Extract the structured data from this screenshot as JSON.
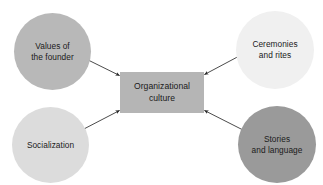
{
  "diagram": {
    "type": "convergent-influence-diagram",
    "background_color": "#ffffff",
    "center": {
      "id": "organizational-culture",
      "label": "Organizational\nculture",
      "shape": "rectangle",
      "fill_color": "#b5b5b5"
    },
    "sources": [
      {
        "id": "values-of-the-founder",
        "label": "Values of\nthe founder",
        "shape": "circle",
        "fill_color": "#b8b8b8",
        "position": "top-left"
      },
      {
        "id": "ceremonies-and-rites",
        "label": "Ceremonies\nand rites",
        "shape": "circle",
        "fill_color": "#f0f0f0",
        "position": "top-right"
      },
      {
        "id": "socialization",
        "label": "Socialization",
        "shape": "circle",
        "fill_color": "#dcdcdc",
        "position": "bottom-left"
      },
      {
        "id": "stories-and-language",
        "label": "Stories\nand language",
        "shape": "circle",
        "fill_color": "#9a9a9a",
        "position": "bottom-right"
      }
    ],
    "arrows": [
      {
        "id": "arrow-values-to-culture",
        "from": "values-of-the-founder",
        "to": "organizational-culture",
        "color": "#2b2b2b"
      },
      {
        "id": "arrow-ceremonies-to-culture",
        "from": "ceremonies-and-rites",
        "to": "organizational-culture",
        "color": "#2b2b2b"
      },
      {
        "id": "arrow-socialization-to-culture",
        "from": "socialization",
        "to": "organizational-culture",
        "color": "#2b2b2b"
      },
      {
        "id": "arrow-stories-to-culture",
        "from": "stories-and-language",
        "to": "organizational-culture",
        "color": "#2b2b2b"
      }
    ]
  }
}
